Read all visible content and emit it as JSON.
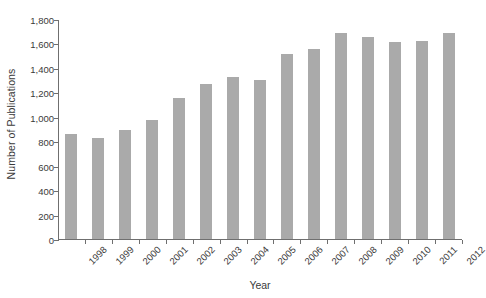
{
  "chart_data": {
    "type": "bar",
    "title": "",
    "subtitle": "",
    "xlabel": "Year",
    "ylabel": "Number of Publications",
    "categories": [
      "1998",
      "1999",
      "2000",
      "2001",
      "2002",
      "2003",
      "2004",
      "2005",
      "2006",
      "2007",
      "2008",
      "2009",
      "2010",
      "2011",
      "2012"
    ],
    "values": [
      860,
      830,
      890,
      975,
      1150,
      1265,
      1325,
      1300,
      1515,
      1555,
      1685,
      1650,
      1610,
      1620,
      1685
    ],
    "series": [
      {
        "name": "Number of Publications",
        "values": [
          860,
          830,
          890,
          975,
          1150,
          1265,
          1325,
          1300,
          1515,
          1555,
          1685,
          1650,
          1610,
          1620,
          1685
        ]
      }
    ],
    "ylim": [
      0,
      1800
    ],
    "ytick_step": 200,
    "ytick_labels": [
      "0",
      "200",
      "400",
      "600",
      "800",
      "1,000",
      "1,200",
      "1,400",
      "1,600",
      "1,800"
    ],
    "ytick_values": [
      0,
      200,
      400,
      600,
      800,
      1000,
      1200,
      1400,
      1600,
      1800
    ],
    "grid": false,
    "legend": false,
    "legend_position": "none",
    "bar_color": "#aaaaaa",
    "axis_color": "#6f6f6f",
    "background_color": "#ffffff",
    "xtick_label_rotation": -45
  }
}
